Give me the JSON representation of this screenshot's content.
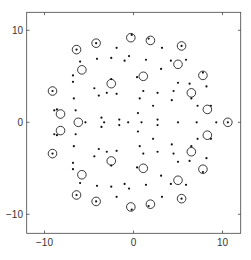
{
  "chart_data": {
    "type": "scatter",
    "title": "",
    "xlabel": "",
    "ylabel": "",
    "xlim": [
      -12,
      12
    ],
    "ylim": [
      -12,
      12
    ],
    "grid": false,
    "legend": null,
    "x_ticks": [
      -10,
      0,
      10
    ],
    "y_ticks": [
      -10,
      0,
      10
    ],
    "x_tick_labels": [
      "−10",
      "0",
      "10"
    ],
    "y_tick_labels": [
      "10",
      "0",
      "−10"
    ],
    "symmetry": "mirror about y=0",
    "series": [
      {
        "name": "dots",
        "marker": "filled-dot",
        "color": "#000000",
        "points_upper_half": [
          [
            -0.2,
            9.5
          ],
          [
            1.7,
            9.1
          ],
          [
            -6.4,
            7.9
          ],
          [
            -4.2,
            8.6
          ],
          [
            5.4,
            8.3
          ],
          [
            -1.9,
            8.1
          ],
          [
            3.2,
            8.1
          ],
          [
            -6.0,
            6.6
          ],
          [
            -4.1,
            6.9
          ],
          [
            -2.5,
            7.0
          ],
          [
            -1.0,
            6.7
          ],
          [
            -0.5,
            7.2
          ],
          [
            1.4,
            6.8
          ],
          [
            4.2,
            6.7
          ],
          [
            5.9,
            6.8
          ],
          [
            3.1,
            5.8
          ],
          [
            -6.8,
            5.1
          ],
          [
            -6.8,
            4.4
          ],
          [
            -9.1,
            3.4
          ],
          [
            -2.5,
            4.7
          ],
          [
            -4.4,
            3.7
          ],
          [
            -3.9,
            2.9
          ],
          [
            -3.0,
            3.2
          ],
          [
            -1.9,
            3.1
          ],
          [
            -6.7,
            2.6
          ],
          [
            -6.5,
            1.3
          ],
          [
            -8.9,
            1.3
          ],
          [
            -8.6,
            1.4
          ],
          [
            -3.6,
            0.5
          ],
          [
            -1.6,
            0.3
          ],
          [
            0.4,
            4.9
          ],
          [
            7.8,
            5.4
          ],
          [
            5.0,
            4.3
          ],
          [
            6.3,
            4.2
          ],
          [
            8.2,
            3.9
          ],
          [
            1.1,
            3.4
          ],
          [
            2.7,
            3.2
          ],
          [
            4.5,
            3.4
          ],
          [
            6.5,
            2.6
          ],
          [
            0.7,
            2.6
          ],
          [
            4.3,
            2.4
          ],
          [
            2.2,
            1.8
          ],
          [
            7.2,
            1.8
          ],
          [
            8.7,
            1.8
          ],
          [
            0.5,
            1.0
          ],
          [
            2.7,
            0.3
          ]
        ],
        "points_on_axis": [
          [
            -5.4,
            0
          ],
          [
            -3.3,
            0
          ],
          [
            -0.6,
            0
          ],
          [
            0.9,
            0
          ],
          [
            5.0,
            0
          ],
          [
            7.1,
            0
          ],
          [
            9.3,
            0
          ],
          [
            10.6,
            0
          ]
        ]
      },
      {
        "name": "circles",
        "marker": "open-circle",
        "color": "#000000",
        "points_upper_half": [
          [
            -6.4,
            7.9
          ],
          [
            -4.2,
            8.6
          ],
          [
            -0.3,
            9.2
          ],
          [
            1.9,
            8.9
          ],
          [
            5.4,
            8.3
          ],
          [
            -5.8,
            5.7
          ],
          [
            5.0,
            6.3
          ],
          [
            -9.1,
            3.4
          ],
          [
            -2.5,
            4.2
          ],
          [
            1.1,
            5.0
          ],
          [
            7.8,
            5.1
          ],
          [
            6.5,
            3.2
          ],
          [
            -8.2,
            0.9
          ],
          [
            8.3,
            1.4
          ]
        ],
        "points_on_axis": [
          [
            -6.2,
            0
          ],
          [
            10.6,
            0
          ]
        ]
      }
    ]
  }
}
